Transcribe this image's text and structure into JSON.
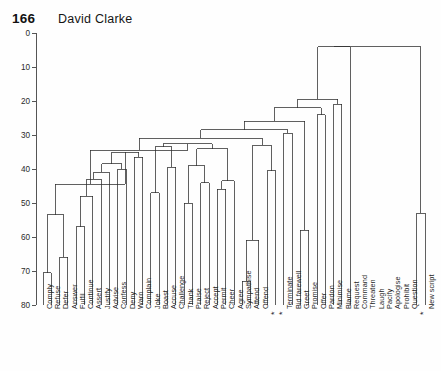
{
  "page": {
    "folio": "166",
    "author": "David Clarke"
  },
  "chart_data": {
    "type": "dendrogram",
    "title": "",
    "subtitle": "",
    "xlabel": "",
    "ylabel": "",
    "ylim": [
      0,
      80
    ],
    "y_axis_inverted": true,
    "grid": false,
    "legend": null,
    "y_ticks": [
      0,
      10,
      20,
      30,
      40,
      50,
      60,
      70,
      80
    ],
    "y_tick_labels": [
      "0",
      "10",
      "20",
      "30",
      "40",
      "50",
      "60",
      "70",
      "80"
    ],
    "leaf_order": [
      "Comply",
      "Refuse",
      "Defer",
      "Answer",
      "Fulfil",
      "Continue",
      "Assert",
      "Justify",
      "Advise",
      "Confess",
      "Deny",
      "Warn",
      "Complain",
      "Joke",
      "Boast",
      "Accuse",
      "Challenge",
      "Thank",
      "Praise",
      "Reject",
      "Accept",
      "Permit",
      "Cheer",
      "Agree",
      "Sympathise",
      "Attend",
      "Offend",
      "*",
      "*",
      "Terminate",
      "Bid farewell",
      "Greet",
      "Promise",
      "Offer",
      "Pardon",
      "Minimise",
      "Blame",
      "Request",
      "Command",
      "Threaten",
      "Laugh",
      "Pacify",
      "Apologise",
      "Prohibit",
      "Question",
      "*",
      "New script"
    ],
    "n_leaves": 47,
    "merges": [
      {
        "id": "m1",
        "left": {
          "leaf": 0
        },
        "right": {
          "leaf": 1
        },
        "height": 70.5
      },
      {
        "id": "m2",
        "left": {
          "leaf": 2
        },
        "right": {
          "leaf": 3
        },
        "height": 66.0
      },
      {
        "id": "m3",
        "left": {
          "node": "m1"
        },
        "right": {
          "node": "m2"
        },
        "height": 53.5
      },
      {
        "id": "m4",
        "left": {
          "leaf": 4
        },
        "right": {
          "leaf": 5
        },
        "height": 57.0
      },
      {
        "id": "m5",
        "left": {
          "node": "m4"
        },
        "right": {
          "leaf": 6
        },
        "height": 48.0
      },
      {
        "id": "m6",
        "left": {
          "node": "m5"
        },
        "right": {
          "leaf": 7
        },
        "height": 43.0
      },
      {
        "id": "m7",
        "left": {
          "node": "m6"
        },
        "right": {
          "leaf": 8
        },
        "height": 41.0
      },
      {
        "id": "m8",
        "left": {
          "leaf": 9
        },
        "right": {
          "leaf": 10
        },
        "height": 40.0
      },
      {
        "id": "m9",
        "left": {
          "node": "m7"
        },
        "right": {
          "node": "m8"
        },
        "height": 38.5
      },
      {
        "id": "m10",
        "left": {
          "leaf": 11
        },
        "right": {
          "leaf": 12
        },
        "height": 36.5
      },
      {
        "id": "m11",
        "left": {
          "node": "m9"
        },
        "right": {
          "node": "m10"
        },
        "height": 35.0
      },
      {
        "id": "m12",
        "left": {
          "node": "m3"
        },
        "right": {
          "node": "m11"
        },
        "height": 44.5
      },
      {
        "id": "m13",
        "left": {
          "leaf": 13
        },
        "right": {
          "leaf": 14
        },
        "height": 47.0
      },
      {
        "id": "m14",
        "left": {
          "leaf": 15
        },
        "right": {
          "leaf": 16
        },
        "height": 39.5
      },
      {
        "id": "m15",
        "left": {
          "node": "m13"
        },
        "right": {
          "node": "m14"
        },
        "height": 33.5
      },
      {
        "id": "m16",
        "left": {
          "leaf": 17
        },
        "right": {
          "leaf": 18
        },
        "height": 50.0
      },
      {
        "id": "m17",
        "left": {
          "leaf": 19
        },
        "right": {
          "leaf": 20
        },
        "height": 44.0
      },
      {
        "id": "m18",
        "left": {
          "node": "m16"
        },
        "right": {
          "node": "m17"
        },
        "height": 39.0
      },
      {
        "id": "m19",
        "left": {
          "leaf": 21
        },
        "right": {
          "leaf": 22
        },
        "height": 46.0
      },
      {
        "id": "m20",
        "left": {
          "node": "m19"
        },
        "right": {
          "leaf": 23
        },
        "height": 43.5
      },
      {
        "id": "m21",
        "left": {
          "node": "m18"
        },
        "right": {
          "node": "m20"
        },
        "height": 34.0
      },
      {
        "id": "m22",
        "left": {
          "node": "m15"
        },
        "right": {
          "node": "m21"
        },
        "height": 32.5
      },
      {
        "id": "m23",
        "left": {
          "node": "m12"
        },
        "right": {
          "node": "m22"
        },
        "height": 34.5
      },
      {
        "id": "m24",
        "left": {
          "leaf": 24
        },
        "right": {
          "leaf": 25
        },
        "height": 73.0
      },
      {
        "id": "m25",
        "left": {
          "node": "m24"
        },
        "right": {
          "leaf": 26
        },
        "height": 61.0
      },
      {
        "id": "m26",
        "left": {
          "leaf": 27
        },
        "right": {
          "leaf": 28
        },
        "height": 40.5
      },
      {
        "id": "m27",
        "left": {
          "node": "m25"
        },
        "right": {
          "node": "m26"
        },
        "height": 33.0
      },
      {
        "id": "m28",
        "left": {
          "node": "m23"
        },
        "right": {
          "node": "m27"
        },
        "height": 31.0
      },
      {
        "id": "m29",
        "left": {
          "leaf": 29
        },
        "right": {
          "leaf": 30
        },
        "height": 29.5
      },
      {
        "id": "m30",
        "left": {
          "node": "m28"
        },
        "right": {
          "node": "m29"
        },
        "height": 28.5
      },
      {
        "id": "m31",
        "left": {
          "leaf": 31
        },
        "right": {
          "leaf": 32
        },
        "height": 58.0
      },
      {
        "id": "m32",
        "left": {
          "node": "m30"
        },
        "right": {
          "node": "m31"
        },
        "height": 26.0
      },
      {
        "id": "m33",
        "left": {
          "leaf": 33
        },
        "right": {
          "leaf": 34
        },
        "height": 24.0
      },
      {
        "id": "m34",
        "left": {
          "node": "m32"
        },
        "right": {
          "node": "m33"
        },
        "height": 22.0
      },
      {
        "id": "m35",
        "left": {
          "leaf": 35
        },
        "right": {
          "leaf": 36
        },
        "height": 21.0
      },
      {
        "id": "m36",
        "left": {
          "node": "m34"
        },
        "right": {
          "node": "m35"
        },
        "height": 19.5
      },
      {
        "id": "m37",
        "left": {
          "node": "m36"
        },
        "right": {
          "leaf": 37
        },
        "height": 4.0
      },
      {
        "id": "root",
        "left": {
          "node": "m37"
        },
        "right": {
          "node": "m38"
        },
        "height": 4.0
      }
    ]
  }
}
